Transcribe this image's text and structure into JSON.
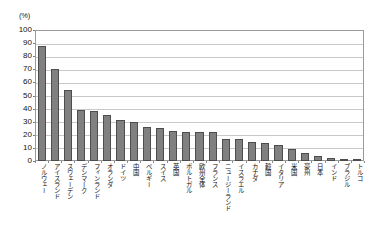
{
  "chart_data": {
    "type": "bar",
    "title": "",
    "xlabel": "",
    "ylabel": "",
    "unit_label": "(%)",
    "ylim": [
      0,
      100
    ],
    "ytick_step": 10,
    "yticks": [
      "0",
      "10",
      "20",
      "30",
      "40",
      "50",
      "60",
      "70",
      "80",
      "90",
      "100"
    ],
    "grid": true,
    "legend": "none",
    "bar_color": "#808080",
    "bar_border_color": "#4d4d4d",
    "gridline_color": "#c9c9c9",
    "axis_color": "#9a9a9a",
    "categories": [
      "ノルウェー",
      "アイスランド",
      "スウェーデン",
      "デンマーク",
      "フィンランド",
      "オランダ",
      "ドイツ",
      "中国",
      "ベルギー",
      "スイス",
      "英国",
      "ポルトガル",
      "欧州全体",
      "フランス",
      "ニュージーランド",
      "イスラエル",
      "カナダ",
      "韓国",
      "イタリア",
      "米国",
      "豪州",
      "日本",
      "インド",
      "ブラジル",
      "トルコ"
    ],
    "values": [
      88,
      70,
      54,
      39,
      38,
      35,
      31,
      29.5,
      26,
      25,
      23,
      22,
      22,
      22,
      17,
      17,
      14.5,
      14,
      12.5,
      9,
      6,
      4,
      2,
      1.5,
      1.5
    ]
  }
}
